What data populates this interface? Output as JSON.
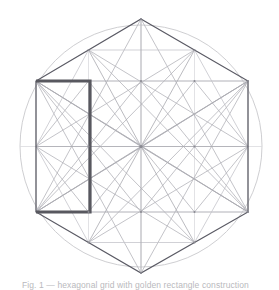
{
  "figure": {
    "caption": "Fig. 1 — hexagonal grid with golden rectangle construction"
  },
  "colors": {
    "background": "#ffffff",
    "circle_stroke": "#c8c8cc",
    "hexagon_stroke": "#5a5a64",
    "construction_light": "#d6d6da",
    "construction_mid": "#a9a9b0",
    "highlight_stroke": "#58585f",
    "caption_text": "#b9b9bd"
  },
  "geometry": {
    "canvas": {
      "width": 279,
      "height": 290
    },
    "circle": {
      "cx": 141,
      "cy": 146,
      "r": 121,
      "stroke_width": 0.9
    },
    "hexagon": {
      "stroke_width": 1.25,
      "orientation": "pointy-top",
      "vertices": [
        {
          "name": "top",
          "x": 141,
          "y": 19
        },
        {
          "name": "upper-right",
          "x": 248,
          "y": 81
        },
        {
          "name": "lower-right",
          "x": 248,
          "y": 212
        },
        {
          "name": "bottom",
          "x": 141,
          "y": 273
        },
        {
          "name": "lower-left",
          "x": 36,
          "y": 212
        },
        {
          "name": "upper-left",
          "x": 36,
          "y": 81
        }
      ]
    },
    "bounding_box": {
      "x1": 36,
      "y1": 81,
      "x2": 248,
      "y2": 212
    },
    "edge_midpoints": [
      {
        "name": "top-right-mid",
        "x": 194.5,
        "y": 50
      },
      {
        "name": "right-mid",
        "x": 248,
        "y": 146.5
      },
      {
        "name": "bottom-right-mid",
        "x": 194.5,
        "y": 242.5
      },
      {
        "name": "bottom-left-mid",
        "x": 88.5,
        "y": 242.5
      },
      {
        "name": "left-mid",
        "x": 36,
        "y": 146.5
      },
      {
        "name": "top-left-mid",
        "x": 88.5,
        "y": 50
      }
    ],
    "center": {
      "x": 141,
      "y": 146
    },
    "grid_columns": [
      36,
      88.5,
      141,
      194.5,
      248
    ],
    "grid_rows": [
      81,
      146.5,
      212
    ],
    "highlight_rectangle": {
      "x": 36,
      "y": 81,
      "width": 54,
      "height": 131,
      "stroke_width": 3.2,
      "open_side": "left",
      "label": "highlighted-rectangle"
    }
  },
  "layers": [
    {
      "name": "circumscribed-circle",
      "visible": true
    },
    {
      "name": "construction-grid",
      "visible": true
    },
    {
      "name": "star-polygon-lines",
      "visible": true
    },
    {
      "name": "radial-lines",
      "visible": true
    },
    {
      "name": "hexagon-outline",
      "visible": true
    },
    {
      "name": "highlight-rectangle",
      "visible": true
    }
  ]
}
